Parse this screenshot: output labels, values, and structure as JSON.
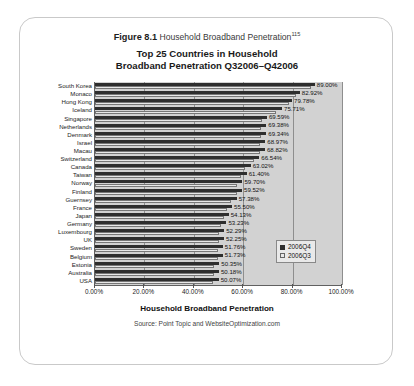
{
  "caption": {
    "figure_number": "Figure 8.1",
    "figure_text": "Household Broadband Penetration",
    "footnote_marker": "115"
  },
  "chart_title_line1": "Top 25 Countries in Household",
  "chart_title_line2": "Broadband Penetration Q32006–Q42006",
  "axis_title": "Household Broadband Penetration",
  "source": "Source: Point Topic and WebsiteOptimization.com",
  "legend": {
    "items": [
      {
        "label": "2006Q4",
        "color": "#2e2e2e"
      },
      {
        "label": "2006Q3",
        "color": "#e8e8e8"
      }
    ]
  },
  "chart_data": {
    "type": "bar",
    "orientation": "horizontal",
    "title": "Top 25 Countries in Household Broadband Penetration Q32006–Q42006",
    "xlabel": "Household Broadband Penetration",
    "ylabel": "",
    "xlim": [
      0,
      100
    ],
    "xtick_labels": [
      "0.00%",
      "20.00%",
      "40.00%",
      "60.00%",
      "80.00%",
      "100.00%"
    ],
    "xticks": [
      0,
      20,
      40,
      60,
      80,
      100
    ],
    "grid": true,
    "legend_position": "inside-right",
    "categories": [
      "South Korea",
      "Monaco",
      "Hong Kong",
      "Iceland",
      "Singapore",
      "Netherlands",
      "Denmark",
      "Israel",
      "Macau",
      "Switzerland",
      "Canada",
      "Taiwan",
      "Norway",
      "Finland",
      "Guernsey",
      "France",
      "Japan",
      "Germany",
      "Luxembourg",
      "UK",
      "Sweden",
      "Belgium",
      "Estonia",
      "Australia",
      "USA"
    ],
    "series": [
      {
        "name": "2006Q4",
        "color": "#2e2e2e",
        "values": [
          89.0,
          82.92,
          79.78,
          75.71,
          69.59,
          69.38,
          69.34,
          68.97,
          68.82,
          66.54,
          63.02,
          61.4,
          59.7,
          59.52,
          57.38,
          55.5,
          54.13,
          53.23,
          52.29,
          52.25,
          51.76,
          51.73,
          50.35,
          50.18,
          50.07
        ],
        "labels": [
          "89.00%",
          "82.92%",
          "79.78%",
          "75.71%",
          "69.59%",
          "69.38%",
          "69.34%",
          "68.97%",
          "68.82%",
          "66.54%",
          "63.02%",
          "61.40%",
          "59.70%",
          "59.52%",
          "57.38%",
          "55.50%",
          "54.13%",
          "53.23%",
          "52.29%",
          "52.25%",
          "51.76%",
          "51.73%",
          "50.35%",
          "50.18%",
          "50.07%"
        ]
      },
      {
        "name": "2006Q3",
        "color": "#e8e8e8",
        "values": [
          87.4,
          81.3,
          78.5,
          73.2,
          67.8,
          67.2,
          67.1,
          66.9,
          66.7,
          64.3,
          60.9,
          59.2,
          57.6,
          57.4,
          55.2,
          53.4,
          52.1,
          51.2,
          50.3,
          50.2,
          49.7,
          49.6,
          48.2,
          48.0,
          47.9
        ]
      }
    ]
  }
}
